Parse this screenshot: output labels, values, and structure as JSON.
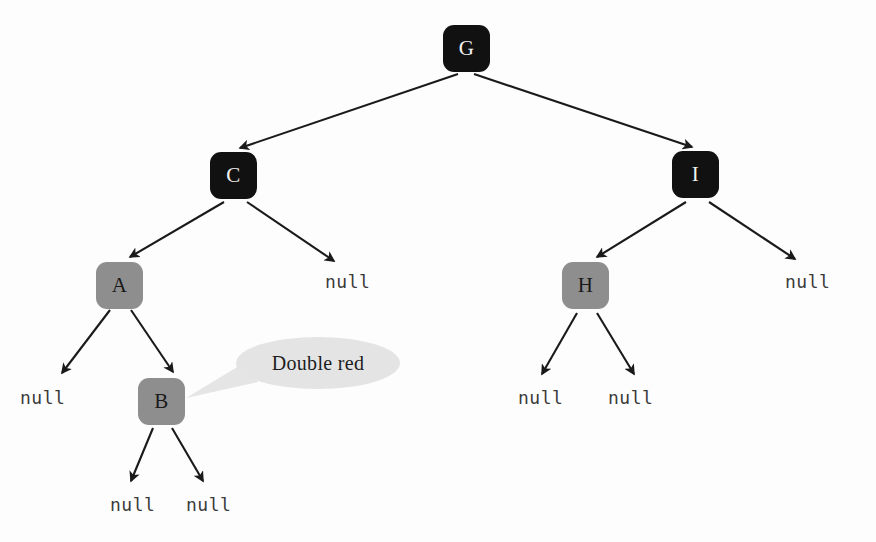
{
  "diagram": {
    "colors": {
      "black_node": "#111111",
      "red_node": "#8e8e8e",
      "callout_fill": "#e4e4e4",
      "edge": "#1a1a1a",
      "background": "#fdfdfd",
      "null_text": "#3a3a3a"
    },
    "nodes": [
      {
        "id": "G",
        "label": "G",
        "color": "black",
        "x": 443,
        "y": 25
      },
      {
        "id": "C",
        "label": "C",
        "color": "black",
        "x": 210,
        "y": 152
      },
      {
        "id": "I",
        "label": "I",
        "color": "black",
        "x": 672,
        "y": 151
      },
      {
        "id": "A",
        "label": "A",
        "color": "red",
        "x": 96,
        "y": 262
      },
      {
        "id": "H",
        "label": "H",
        "color": "red",
        "x": 562,
        "y": 262
      },
      {
        "id": "B",
        "label": "B",
        "color": "red",
        "x": 138,
        "y": 378
      }
    ],
    "null_leaves": [
      {
        "id": "null-c-right",
        "label": "null",
        "x": 325,
        "y": 271
      },
      {
        "id": "null-i-right",
        "label": "null",
        "x": 785,
        "y": 271
      },
      {
        "id": "null-a-left",
        "label": "null",
        "x": 20,
        "y": 387
      },
      {
        "id": "null-h-left",
        "label": "null",
        "x": 518,
        "y": 387
      },
      {
        "id": "null-h-right",
        "label": "null",
        "x": 608,
        "y": 387
      },
      {
        "id": "null-b-left",
        "label": "null",
        "x": 110,
        "y": 494
      },
      {
        "id": "null-b-right",
        "label": "null",
        "x": 186,
        "y": 494
      }
    ],
    "edges": [
      {
        "from": "G",
        "to": "C",
        "x1": 458,
        "y1": 74,
        "x2": 240,
        "y2": 148
      },
      {
        "from": "G",
        "to": "I",
        "x1": 474,
        "y1": 74,
        "x2": 692,
        "y2": 147
      },
      {
        "from": "C",
        "to": "A",
        "x1": 224,
        "y1": 202,
        "x2": 130,
        "y2": 257
      },
      {
        "from": "C",
        "to": "null-c-right",
        "x1": 247,
        "y1": 202,
        "x2": 334,
        "y2": 261
      },
      {
        "from": "I",
        "to": "H",
        "x1": 686,
        "y1": 202,
        "x2": 597,
        "y2": 257
      },
      {
        "from": "I",
        "to": "null-i-right",
        "x1": 709,
        "y1": 202,
        "x2": 795,
        "y2": 259
      },
      {
        "from": "A",
        "to": "null-a-left",
        "x1": 110,
        "y1": 310,
        "x2": 62,
        "y2": 373
      },
      {
        "from": "A",
        "to": "B",
        "x1": 131,
        "y1": 310,
        "x2": 173,
        "y2": 372
      },
      {
        "from": "H",
        "to": "null-h-left",
        "x1": 577,
        "y1": 313,
        "x2": 542,
        "y2": 374
      },
      {
        "from": "H",
        "to": "null-h-right",
        "x1": 597,
        "y1": 313,
        "x2": 634,
        "y2": 374
      },
      {
        "from": "B",
        "to": "null-b-left",
        "x1": 153,
        "y1": 428,
        "x2": 131,
        "y2": 481
      },
      {
        "from": "B",
        "to": "null-b-right",
        "x1": 172,
        "y1": 428,
        "x2": 203,
        "y2": 481
      }
    ],
    "callout": {
      "label": "Double red",
      "points_to": "B"
    }
  }
}
